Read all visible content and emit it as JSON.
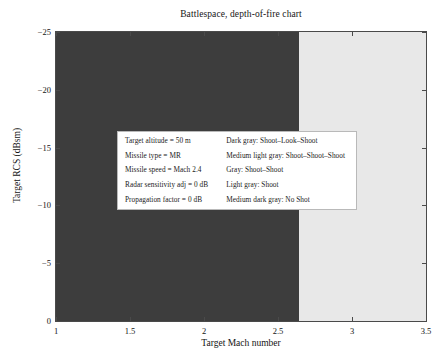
{
  "chart_data": {
    "type": "heatmap",
    "title": "Battlespace, depth-of-fire chart",
    "xlabel": "Target Mach number",
    "ylabel": "Target RCS (dBsm)",
    "xlim": [
      1,
      3.5
    ],
    "ylim": [
      -25,
      0
    ],
    "y_inverted": true,
    "grid": false,
    "legend_position": "inside-center",
    "xticks": [
      {
        "value": 1,
        "label": "1"
      },
      {
        "value": 1.5,
        "label": "1.5"
      },
      {
        "value": 2,
        "label": "2"
      },
      {
        "value": 2.5,
        "label": "2.5"
      },
      {
        "value": 3,
        "label": "3"
      },
      {
        "value": 3.5,
        "label": "3.5"
      }
    ],
    "yticks": [
      {
        "value": -25,
        "label": "−25"
      },
      {
        "value": -20,
        "label": "−20"
      },
      {
        "value": -15,
        "label": "−15"
      },
      {
        "value": -10,
        "label": "−10"
      },
      {
        "value": -5,
        "label": "−5"
      },
      {
        "value": 0,
        "label": "0"
      }
    ],
    "categories": [
      "Shoot-Look-Shoot",
      "Shoot-Shoot-Shoot",
      "Shoot-Shoot",
      "Shoot",
      "No Shot"
    ],
    "colors": {
      "dark_gray": "#3d3d3d",
      "medium_light_gray": "#c9c9c9",
      "gray": "#8a8a8a",
      "light_gray": "#e8e8e8",
      "medium_dark_gray": "#5e5e5e",
      "axis": "#4a4a4a",
      "text": "#141414",
      "legend_background": "#ffffff",
      "legend_border": "#b9b9b9"
    },
    "regions": [
      {
        "name": "shoot-look-shoot-region",
        "label": "Shoot-Look-Shoot",
        "color": "#3d3d3d",
        "x_range": [
          1.0,
          2.645
        ],
        "y_range": [
          -25.0,
          0.0
        ]
      },
      {
        "name": "shoot-look-shoot-step-upper",
        "label": "Shoot-Look-Shoot",
        "color": "#3d3d3d",
        "x_range": [
          1.0,
          2.575
        ],
        "y_range": [
          -25.0,
          -24.4
        ]
      },
      {
        "name": "shoot-look-shoot-step-middle",
        "label": "Shoot-Look-Shoot",
        "color": "#3d3d3d",
        "x_range": [
          1.0,
          2.645
        ],
        "y_range": [
          -24.4,
          -23.5
        ]
      },
      {
        "name": "shoot-region",
        "label": "Shoot",
        "color": "#e8e8e8",
        "x_range": [
          2.645,
          3.5
        ],
        "y_range": [
          -25.0,
          0.0
        ]
      }
    ]
  },
  "legend": {
    "parameters": [
      "Target altitude = 50 m",
      "Missile type = MR",
      "Missile speed = Mach 2.4",
      "Radar sensitivity adj = 0 dB",
      "Propagation factor = 0 dB"
    ],
    "classes": [
      "Dark gray: Shoot–Look–Shoot",
      "Medium light gray: Shoot–Shoot–Shoot",
      "Gray: Shoot–Shoot",
      "Light gray: Shoot",
      "Medium dark gray: No Shot"
    ]
  }
}
